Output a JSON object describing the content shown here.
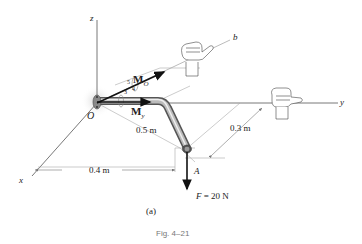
{
  "figure": {
    "axes": {
      "x": "x",
      "y": "y",
      "z": "z",
      "b": "b"
    },
    "points": {
      "origin": "O",
      "end": "A"
    },
    "vectors": {
      "moment_O": "M",
      "moment_O_sub": "O",
      "moment_y": "M",
      "moment_y_sub": "y"
    },
    "slope": {
      "hyp": "5",
      "rise": "3",
      "run": "4"
    },
    "dimensions": {
      "d1": "0.5 m",
      "d2": "0.3 m",
      "d3": "0.4 m"
    },
    "force": "F = 20 N",
    "force_var": "F",
    "force_val": "= 20 N",
    "subfigure": "(a)",
    "caption": "Fig. 4–21",
    "colors": {
      "line": "#555555",
      "light": "#aaaaaa",
      "pipe": "#8a8a8a",
      "arrow": "#111111"
    }
  }
}
